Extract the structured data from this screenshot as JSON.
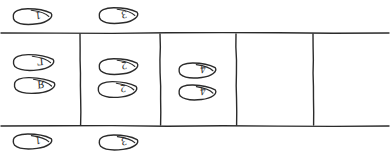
{
  "diagram": {
    "background_color": "#ffffff",
    "ink_color": "#2b2b2b",
    "stroke_width": 1.4,
    "width": 390,
    "height": 153
  },
  "grid": {
    "top_line_y": 33,
    "bottom_line_y": 126,
    "left_x": 1,
    "right_x": 389,
    "column_dividers_x": [
      80,
      160,
      236,
      313
    ],
    "cells": [
      {
        "index": 0,
        "x_start": 1,
        "x_end": 80,
        "occupied": true
      },
      {
        "index": 1,
        "x_start": 80,
        "x_end": 160,
        "occupied": true
      },
      {
        "index": 2,
        "x_start": 160,
        "x_end": 236,
        "occupied": true
      },
      {
        "index": 3,
        "x_start": 236,
        "x_end": 313,
        "occupied": false
      },
      {
        "index": 4,
        "x_start": 313,
        "x_end": 389,
        "occupied": false
      }
    ]
  },
  "footprints": [
    {
      "id": "fp-top-1",
      "label": "1",
      "region": "above-grid",
      "cx": 31,
      "cy": 16,
      "tilt": -6,
      "w": 44,
      "h": 19,
      "flip": false
    },
    {
      "id": "fp-top-3",
      "label": "3",
      "region": "above-grid",
      "cx": 117,
      "cy": 15,
      "tilt": -6,
      "w": 44,
      "h": 19,
      "flip": false
    },
    {
      "id": "fp-c0-L",
      "label": "Γ",
      "region": "cell-0",
      "cx": 32,
      "cy": 62,
      "tilt": -5,
      "w": 46,
      "h": 19,
      "flip": false
    },
    {
      "id": "fp-c0-R",
      "label": "Я",
      "region": "cell-0",
      "cx": 33,
      "cy": 85,
      "tilt": -4,
      "w": 46,
      "h": 19,
      "flip": false
    },
    {
      "id": "fp-c1-2a",
      "label": "2",
      "region": "cell-1",
      "cx": 117,
      "cy": 66,
      "tilt": -6,
      "w": 44,
      "h": 19,
      "flip": false
    },
    {
      "id": "fp-c1-2b",
      "label": "2",
      "region": "cell-1",
      "cx": 116,
      "cy": 89,
      "tilt": -5,
      "w": 44,
      "h": 19,
      "flip": false
    },
    {
      "id": "fp-c2-4a",
      "label": "4",
      "region": "cell-2",
      "cx": 196,
      "cy": 70,
      "tilt": -5,
      "w": 42,
      "h": 18,
      "flip": false
    },
    {
      "id": "fp-c2-4b",
      "label": "4",
      "region": "cell-2",
      "cx": 196,
      "cy": 92,
      "tilt": -4,
      "w": 42,
      "h": 18,
      "flip": false
    },
    {
      "id": "fp-bot-1",
      "label": "1",
      "region": "below-grid",
      "cx": 31,
      "cy": 141,
      "tilt": -5,
      "w": 44,
      "h": 18,
      "flip": false
    },
    {
      "id": "fp-bot-3",
      "label": "3",
      "region": "below-grid",
      "cx": 117,
      "cy": 142,
      "tilt": -5,
      "w": 44,
      "h": 18,
      "flip": false
    }
  ],
  "legend": {
    "note": "Each outlined shape is a hand-drawn shoe/foot outline containing an upside-down character."
  }
}
